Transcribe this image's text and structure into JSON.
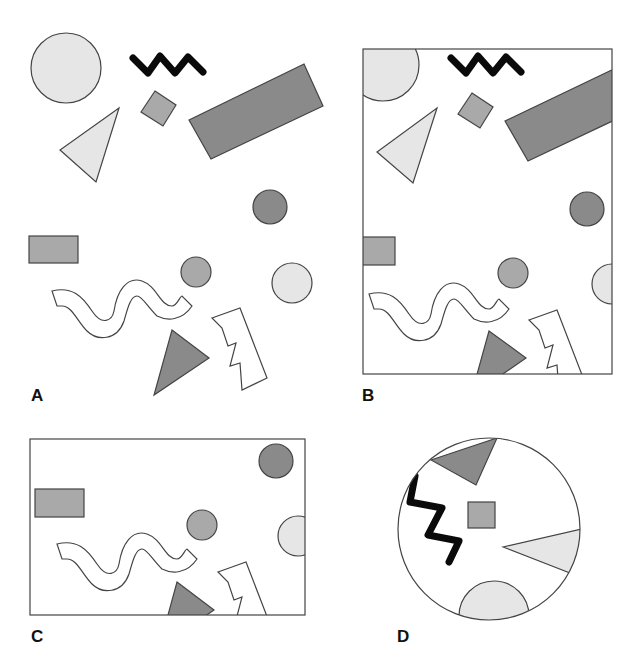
{
  "colors": {
    "light": "#e6e6e6",
    "mid": "#a9a9a9",
    "dark": "#8a8a8a",
    "stroke": "#444444",
    "zigzag": "#0a0a0a"
  },
  "panels": [
    {
      "id": "A",
      "label": "A",
      "frame": "none",
      "description": "Full scene of scattered shapes"
    },
    {
      "id": "B",
      "label": "B",
      "frame": "rectangle-portrait",
      "description": "Portrait rectangular crop of scene"
    },
    {
      "id": "C",
      "label": "C",
      "frame": "rectangle-landscape",
      "description": "Landscape rectangular crop of lower scene"
    },
    {
      "id": "D",
      "label": "D",
      "frame": "circle",
      "description": "Circular crop with rotated shapes"
    }
  ]
}
